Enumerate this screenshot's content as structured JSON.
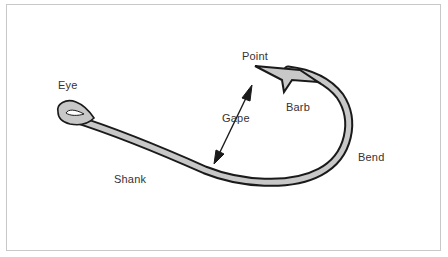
{
  "diagram": {
    "labels": {
      "eye": "Eye",
      "point": "Point",
      "barb": "Barb",
      "gape": "Gape",
      "bend": "Bend",
      "shank": "Shank"
    },
    "colors": {
      "hook_fill": "#c8c8c8",
      "hook_outline": "#1a1a1a",
      "frame_border": "#c8c8c8",
      "label_text": "#333333",
      "background": "#ffffff"
    }
  }
}
